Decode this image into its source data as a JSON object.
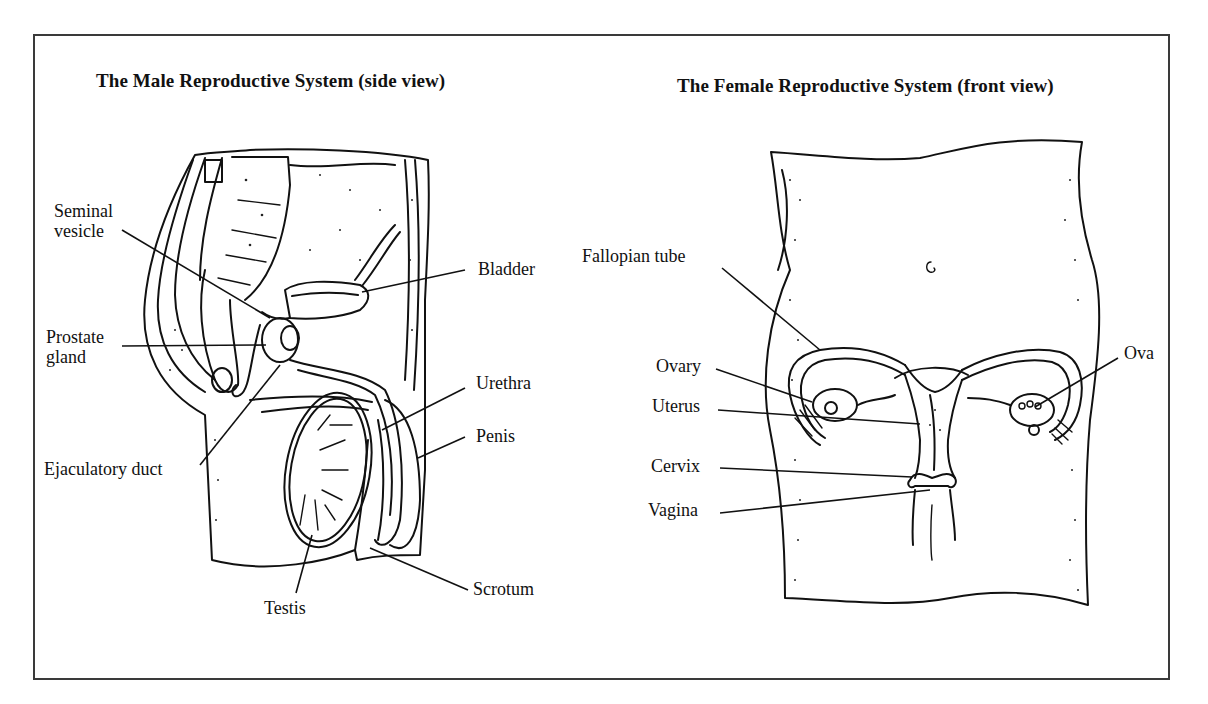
{
  "figure": {
    "border_color": "#3a3a3a",
    "panels": [
      {
        "id": "male",
        "title": "The Male Reproductive System (side view)",
        "labels": [
          {
            "id": "seminal-vesicle",
            "lines": [
              "Seminal",
              "vesicle"
            ]
          },
          {
            "id": "prostate-gland",
            "lines": [
              "Prostate",
              "gland"
            ]
          },
          {
            "id": "ejaculatory-duct",
            "text": "Ejaculatory duct"
          },
          {
            "id": "bladder",
            "text": "Bladder"
          },
          {
            "id": "urethra",
            "text": "Urethra"
          },
          {
            "id": "penis",
            "text": "Penis"
          },
          {
            "id": "scrotum",
            "text": "Scrotum"
          },
          {
            "id": "testis",
            "text": "Testis"
          }
        ]
      },
      {
        "id": "female",
        "title": "The Female Reproductive System (front view)",
        "labels": [
          {
            "id": "fallopian-tube",
            "text": "Fallopian tube"
          },
          {
            "id": "ovary",
            "text": "Ovary"
          },
          {
            "id": "uterus",
            "text": "Uterus"
          },
          {
            "id": "cervix",
            "text": "Cervix"
          },
          {
            "id": "vagina",
            "text": "Vagina"
          },
          {
            "id": "ova",
            "text": "Ova"
          }
        ]
      }
    ]
  }
}
